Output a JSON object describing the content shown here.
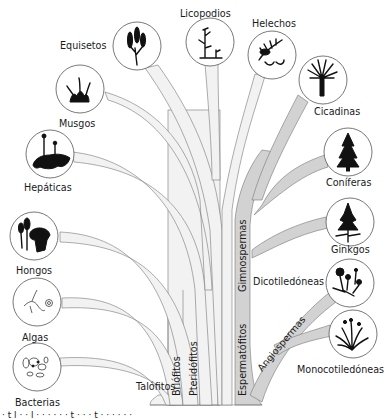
{
  "diagram": {
    "type": "phylogenetic-tree",
    "colors": {
      "branch_light": "#f2f2f2",
      "branch_dark": "#d2d2d2",
      "outline": "#777777",
      "silhouette": "#111111",
      "text": "#1a1a1a"
    },
    "trunk_labels": {
      "talofitos": "Talófitos",
      "briofitos": "Briófitos",
      "pteridofitos": "Pteridófitos",
      "espermatofitos": "Espermatófitos",
      "gimnospermas": "Gimnospermas",
      "angiospermas": "Angiospermas"
    },
    "leaves": {
      "equisetos": "Equisetos",
      "licopodios": "Licopodios",
      "helechos": "Helechos",
      "musgos": "Musgos",
      "hepaticas": "Hepáticas",
      "cicadinas": "Cicadinas",
      "coniferas": "Coníferas",
      "ginkgos": "Ginkgos",
      "hongos": "Hongos",
      "algas": "Algas",
      "bacterias": "Bacterias",
      "dicotiledoneas": "Dicotiledóneas",
      "monocotiledoneas": "Monocotiledóneas"
    },
    "groups": [
      {
        "name": "Talófitos",
        "members": [
          "Bacterias",
          "Algas",
          "Hongos"
        ]
      },
      {
        "name": "Briófitos",
        "members": [
          "Hepáticas",
          "Musgos"
        ]
      },
      {
        "name": "Pteridófitos",
        "members": [
          "Equisetos",
          "Licopodios",
          "Helechos"
        ]
      },
      {
        "name": "Espermatófitos",
        "subgroups": [
          {
            "name": "Gimnospermas",
            "members": [
              "Cicadinas",
              "Coníferas",
              "Ginkgos"
            ]
          },
          {
            "name": "Angiospermas",
            "members": [
              "Dicotiledóneas",
              "Monocotiledóneas"
            ]
          }
        ]
      }
    ],
    "caption_partial": "· t  l ·  ·  l  ·  ·  ·  · ·  ·  t  ·  ·  ·  t  ·  ·  ·  ·  ·  ·"
  }
}
